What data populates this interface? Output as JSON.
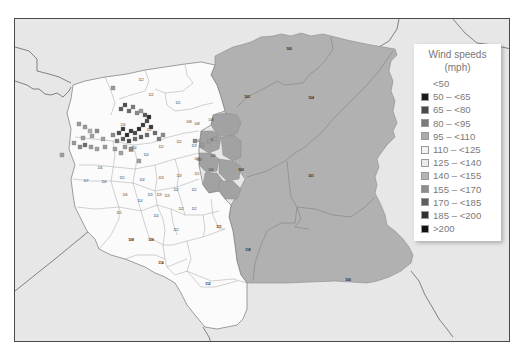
{
  "legend": {
    "title_line1": "Wind speeds",
    "title_line2": "(mph)",
    "items": [
      {
        "label": "<50",
        "color": null
      },
      {
        "label": "50 – <65",
        "color": "#1a1a1a"
      },
      {
        "label": "65 – <80",
        "color": "#4a4a4a"
      },
      {
        "label": "80 – <95",
        "color": "#7a7a7a"
      },
      {
        "label": "95 – <110",
        "color": "#a9a9a9"
      },
      {
        "label": "110 – <125",
        "color": "#f3f3f3"
      },
      {
        "label": "125 – <140",
        "color": "#ebebeb"
      },
      {
        "label": "140 – <155",
        "color": "#b4b4b4"
      },
      {
        "label": "155 – <170",
        "color": "#8e8e8e"
      },
      {
        "label": "170 – <185",
        "color": "#5e5e5e"
      },
      {
        "label": "185 – <200",
        "color": "#333333"
      },
      {
        "label": ">200",
        "color": "#111111"
      }
    ]
  },
  "map": {
    "background_color": "#e7e7e7",
    "white_region_color": "#fbfbfb",
    "gray_region_color": "#b1b1b1",
    "darker_gray_color": "#a2a2a2",
    "large_region_labels": [
      {
        "text": "100",
        "x": 288,
        "y": 49
      },
      {
        "text": "104",
        "x": 310,
        "y": 98
      },
      {
        "text": "102",
        "x": 246,
        "y": 97
      },
      {
        "text": "100",
        "x": 240,
        "y": 170
      },
      {
        "text": "101",
        "x": 310,
        "y": 176
      },
      {
        "text": "118",
        "x": 247,
        "y": 250
      },
      {
        "text": "106",
        "x": 347,
        "y": 280
      },
      {
        "text": "111",
        "x": 218,
        "y": 227
      },
      {
        "text": "112",
        "x": 207,
        "y": 284
      },
      {
        "text": "114",
        "x": 160,
        "y": 263
      },
      {
        "text": "108",
        "x": 130,
        "y": 240
      },
      {
        "text": "106",
        "x": 150,
        "y": 240
      }
    ],
    "county_labels": [
      {
        "text": "112",
        "x": 140,
        "y": 80
      },
      {
        "text": "112",
        "x": 150,
        "y": 95
      },
      {
        "text": "111",
        "x": 177,
        "y": 103
      },
      {
        "text": "116",
        "x": 122,
        "y": 125
      },
      {
        "text": "112",
        "x": 148,
        "y": 130
      },
      {
        "text": "114",
        "x": 133,
        "y": 148
      },
      {
        "text": "114",
        "x": 130,
        "y": 151
      },
      {
        "text": "114",
        "x": 145,
        "y": 155
      },
      {
        "text": "112",
        "x": 160,
        "y": 147
      },
      {
        "text": "112",
        "x": 178,
        "y": 142
      },
      {
        "text": "113",
        "x": 193,
        "y": 146
      },
      {
        "text": "113",
        "x": 198,
        "y": 160
      },
      {
        "text": "111",
        "x": 196,
        "y": 174
      },
      {
        "text": "116",
        "x": 99,
        "y": 168
      },
      {
        "text": "117",
        "x": 85,
        "y": 181
      },
      {
        "text": "116",
        "x": 103,
        "y": 182
      },
      {
        "text": "115",
        "x": 121,
        "y": 178
      },
      {
        "text": "114",
        "x": 141,
        "y": 180
      },
      {
        "text": "113",
        "x": 160,
        "y": 178
      },
      {
        "text": "113",
        "x": 178,
        "y": 176
      },
      {
        "text": "116",
        "x": 124,
        "y": 195
      },
      {
        "text": "114",
        "x": 139,
        "y": 201
      },
      {
        "text": "113",
        "x": 149,
        "y": 195
      },
      {
        "text": "113",
        "x": 158,
        "y": 195
      },
      {
        "text": "113",
        "x": 166,
        "y": 196
      },
      {
        "text": "112",
        "x": 175,
        "y": 190
      },
      {
        "text": "112",
        "x": 193,
        "y": 190
      },
      {
        "text": "115",
        "x": 118,
        "y": 213
      },
      {
        "text": "114",
        "x": 155,
        "y": 216
      },
      {
        "text": "112",
        "x": 180,
        "y": 209
      },
      {
        "text": "112",
        "x": 193,
        "y": 209
      },
      {
        "text": "112",
        "x": 175,
        "y": 230
      },
      {
        "text": "108",
        "x": 188,
        "y": 122
      },
      {
        "text": "108",
        "x": 196,
        "y": 124
      },
      {
        "text": "104",
        "x": 196,
        "y": 141
      },
      {
        "text": "108",
        "x": 210,
        "y": 120
      },
      {
        "text": "106",
        "x": 212,
        "y": 140
      },
      {
        "text": "108",
        "x": 212,
        "y": 156
      },
      {
        "text": "104",
        "x": 196,
        "y": 159
      },
      {
        "text": "106",
        "x": 210,
        "y": 170
      }
    ],
    "station_markers_note": "grid squares shaded by wind-speed class clustered in the NW white region"
  }
}
